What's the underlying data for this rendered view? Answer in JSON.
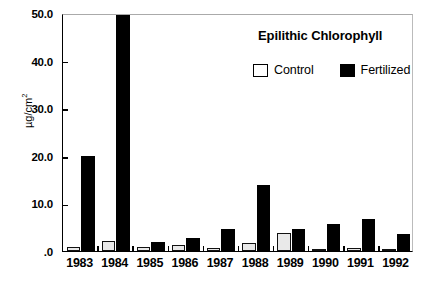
{
  "chart_data": {
    "type": "bar",
    "title": "Epilithic Chlorophyll",
    "xlabel": "",
    "ylabel": "µg/cm2",
    "ylabel_base": "µg/cm",
    "ylabel_sup": "2",
    "ylim": [
      0,
      50
    ],
    "ytick_values": [
      0,
      10,
      20,
      30,
      40,
      50
    ],
    "ytick_labels": [
      ".0",
      "10.0",
      "20.0",
      "30.0",
      "40.0",
      "50.0"
    ],
    "categories": [
      "1983",
      "1984",
      "1985",
      "1986",
      "1987",
      "1988",
      "1989",
      "1990",
      "1991",
      "1992"
    ],
    "grid": false,
    "legend_position": "top-right",
    "series": [
      {
        "name": "Control",
        "color": "#ffffff",
        "values": [
          0.9,
          2.0,
          0.8,
          1.2,
          0.7,
          1.7,
          3.8,
          0.2,
          0.7,
          0.2
        ]
      },
      {
        "name": "Fertilized",
        "color": "#000000",
        "values": [
          20.0,
          50.0,
          1.9,
          2.8,
          4.7,
          13.8,
          4.6,
          5.7,
          6.7,
          3.6
        ]
      }
    ]
  },
  "legend": {
    "items": [
      {
        "label": "Control",
        "swatch": "hollow-square"
      },
      {
        "label": "Fertilized",
        "swatch": "filled-square"
      }
    ]
  },
  "colors": {
    "axis": "#000000",
    "fertilized": "#000000",
    "control_fill": "#e9e9e9",
    "background": "#ffffff"
  }
}
